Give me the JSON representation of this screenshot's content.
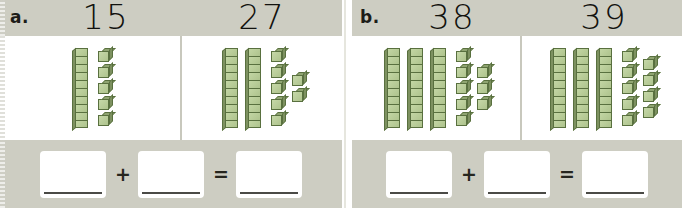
{
  "worksheet": {
    "title": "Base-ten blocks place value worksheet",
    "colors": {
      "band": "#cdcdc2",
      "paper": "#ffffff",
      "block_fill": "#b8cc96",
      "block_outline": "#59703f",
      "ink": "#12120e",
      "writing_line": "#4a4a46"
    },
    "operators": {
      "plus": "+",
      "equals": "="
    },
    "groups": [
      {
        "letter": "a.",
        "cells": [
          {
            "numeral": "15",
            "tens": 1,
            "ones": 5,
            "ones_columns": [
              5
            ],
            "value": 15
          },
          {
            "numeral": "27",
            "tens": 2,
            "ones": 7,
            "ones_columns": [
              5,
              2
            ],
            "value": 27
          }
        ],
        "equation": {
          "addend_1": "",
          "addend_2": "",
          "sum": "",
          "plus": "+",
          "equals": "="
        }
      },
      {
        "letter": "b.",
        "cells": [
          {
            "numeral": "38",
            "tens": 3,
            "ones": 8,
            "ones_columns": [
              5,
              3
            ],
            "value": 38
          },
          {
            "numeral": "39",
            "tens": 3,
            "ones": 9,
            "ones_columns": [
              5,
              4
            ],
            "value": 39
          }
        ],
        "equation": {
          "addend_1": "",
          "addend_2": "",
          "sum": "",
          "plus": "+",
          "equals": "="
        }
      }
    ]
  }
}
